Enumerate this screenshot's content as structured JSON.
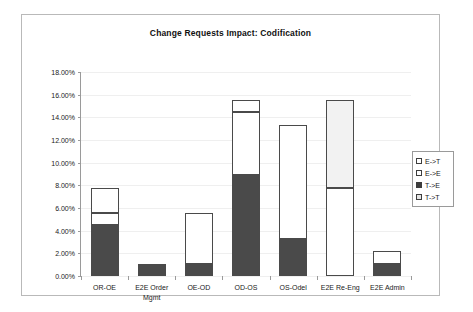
{
  "chart_data": {
    "type": "bar",
    "title": "Change Requests Impact: Codification",
    "xlabel": "",
    "ylabel": "",
    "ylim": [
      0,
      18
    ],
    "ytick_labels": [
      "0.00%",
      "2.00%",
      "4.00%",
      "6.00%",
      "8.00%",
      "10.00%",
      "12.00%",
      "14.00%",
      "16.00%",
      "18.00%"
    ],
    "ytick_values": [
      0,
      2,
      4,
      6,
      8,
      10,
      12,
      14,
      16,
      18
    ],
    "grid": false,
    "stacked": true,
    "legend_position": "right",
    "categories": [
      "OR-OE",
      "E2E Order Mgmt",
      "OE-OD",
      "OD-OS",
      "OS-Odel",
      "E2E Re-Eng",
      "E2E Admin"
    ],
    "series": [
      {
        "name": "E->T",
        "key": "ET",
        "color": "#ffffff",
        "values": [
          2.2,
          0.0,
          0.0,
          1.05,
          0.0,
          0.0,
          0.0
        ]
      },
      {
        "name": "E->E",
        "key": "EE",
        "color": "#ffffff",
        "values": [
          1.05,
          0.0,
          4.5,
          5.6,
          10.0,
          7.75,
          1.15
        ]
      },
      {
        "name": "T->E",
        "key": "TE",
        "color": "#4a4a4a",
        "values": [
          4.5,
          1.1,
          1.1,
          8.9,
          3.3,
          0.0,
          1.1
        ]
      },
      {
        "name": "T->T",
        "key": "TT",
        "color": "#f2f2f2",
        "values": [
          0.0,
          0.0,
          0.0,
          0.0,
          0.0,
          7.75,
          0.0
        ]
      }
    ],
    "totals": [
      7.75,
      1.1,
      5.6,
      15.55,
      13.3,
      15.5,
      2.25
    ],
    "stack_order": [
      "TE",
      "EE",
      "TT",
      "ET"
    ]
  },
  "legend": {
    "items": [
      {
        "label": "E->T",
        "key": "ET"
      },
      {
        "label": "E->E",
        "key": "EE"
      },
      {
        "label": "T->E",
        "key": "TE"
      },
      {
        "label": "T->T",
        "key": "TT"
      }
    ]
  }
}
